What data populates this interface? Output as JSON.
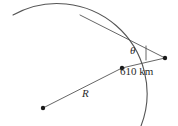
{
  "figure": {
    "type": "geometry-diagram",
    "background_color": "#ffffff",
    "stroke_color": "#555555",
    "point_color": "#1a1a1a",
    "text_color": "#2b2b2b",
    "labels": {
      "angle": "θ",
      "radius": "R",
      "distance": "610 km"
    },
    "points": [
      {
        "name": "circle-center",
        "x": 43,
        "y": 108
      },
      {
        "name": "arc-intersection-point",
        "x": 122,
        "y": 68
      },
      {
        "name": "external-vertex",
        "x": 165,
        "y": 58
      }
    ],
    "arc": {
      "name": "planet-surface-arc",
      "start_x": 13,
      "start_y": 15,
      "end_x": 141,
      "end_y": 126,
      "radius": 90
    },
    "tangent": {
      "name": "tangent-line",
      "tangent_point_x": 80,
      "tangent_point_y": 15,
      "vertex_x": 165,
      "vertex_y": 58
    },
    "angle_marker": {
      "name": "angle-tick",
      "x": 146,
      "y_top": 47,
      "y_bottom": 60
    }
  }
}
